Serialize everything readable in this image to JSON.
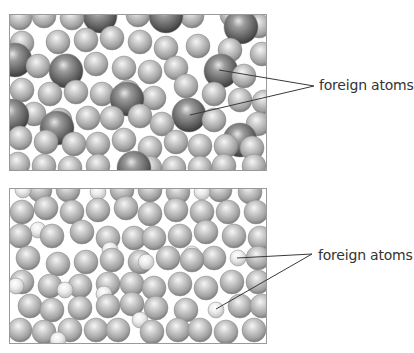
{
  "figure": {
    "width": 410,
    "height": 353,
    "colors": {
      "background": "#ffffff",
      "frame": "#9a9a9a",
      "leader": "#3a3a3a",
      "label": "#333333",
      "host_atom_light": "#f4f4f4",
      "host_atom_mid": "#b4b4b4",
      "host_atom_dark": "#7a7a7a",
      "foreign_large_light": "#dcdcdc",
      "foreign_large_mid": "#6e6e6e",
      "foreign_large_dark": "#3c3c3c",
      "foreign_small_light": "#ffffff",
      "foreign_small_mid": "#e2e2e2",
      "foreign_small_dark": "#b8b8b8"
    }
  },
  "panels": [
    {
      "id": "top",
      "title": "Substitutional impurity with larger foreign atoms",
      "frame": {
        "x": 9,
        "y": 14,
        "w": 257,
        "h": 156
      },
      "label": {
        "text": "foreign atoms",
        "x": 319,
        "y": 77
      },
      "leader_apex": {
        "x": 314,
        "y": 86
      },
      "leader_targets": [
        {
          "x": 219,
          "y": 70
        },
        {
          "x": 190,
          "y": 115
        }
      ],
      "host_radius": 12,
      "foreign_radius": 17,
      "host_atoms": [
        [
          20,
          18
        ],
        [
          44,
          16
        ],
        [
          72,
          18
        ],
        [
          138,
          15
        ],
        [
          192,
          16
        ],
        [
          232,
          15
        ],
        [
          259,
          26
        ],
        [
          22,
          43
        ],
        [
          58,
          42
        ],
        [
          86,
          40
        ],
        [
          112,
          38
        ],
        [
          140,
          42
        ],
        [
          166,
          48
        ],
        [
          198,
          46
        ],
        [
          230,
          50
        ],
        [
          38,
          66
        ],
        [
          68,
          66
        ],
        [
          96,
          64
        ],
        [
          124,
          68
        ],
        [
          150,
          72
        ],
        [
          176,
          68
        ],
        [
          244,
          76
        ],
        [
          262,
          54
        ],
        [
          22,
          90
        ],
        [
          50,
          94
        ],
        [
          76,
          92
        ],
        [
          102,
          94
        ],
        [
          128,
          92
        ],
        [
          154,
          98
        ],
        [
          186,
          86
        ],
        [
          214,
          94
        ],
        [
          240,
          100
        ],
        [
          264,
          102
        ],
        [
          34,
          114
        ],
        [
          60,
          120
        ],
        [
          88,
          118
        ],
        [
          112,
          118
        ],
        [
          140,
          116
        ],
        [
          162,
          124
        ],
        [
          214,
          120
        ],
        [
          258,
          124
        ],
        [
          20,
          138
        ],
        [
          46,
          142
        ],
        [
          74,
          144
        ],
        [
          98,
          144
        ],
        [
          124,
          140
        ],
        [
          150,
          148
        ],
        [
          176,
          142
        ],
        [
          200,
          146
        ],
        [
          226,
          146
        ],
        [
          252,
          148
        ],
        [
          18,
          164
        ],
        [
          44,
          166
        ],
        [
          70,
          168
        ],
        [
          98,
          166
        ],
        [
          150,
          168
        ],
        [
          174,
          168
        ],
        [
          200,
          168
        ],
        [
          224,
          166
        ],
        [
          254,
          166
        ]
      ],
      "foreign_atoms": [
        [
          100,
          16
        ],
        [
          166,
          16
        ],
        [
          241,
          27
        ],
        [
          15,
          60
        ],
        [
          66,
          71
        ],
        [
          221,
          71
        ],
        [
          127,
          99
        ],
        [
          189,
          115
        ],
        [
          12,
          116
        ],
        [
          57,
          128
        ],
        [
          240,
          140
        ],
        [
          134,
          168
        ]
      ]
    },
    {
      "id": "bottom",
      "title": "Substitutional impurity with smaller foreign atoms",
      "frame": {
        "x": 9,
        "y": 188,
        "w": 257,
        "h": 155
      },
      "label": {
        "text": "foreign atoms",
        "x": 318,
        "y": 247
      },
      "leader_apex": {
        "x": 312,
        "y": 254
      },
      "leader_targets": [
        {
          "x": 237,
          "y": 258
        },
        {
          "x": 216,
          "y": 309
        }
      ],
      "host_radius": 12,
      "foreign_radius": 8,
      "host_atoms": [
        [
          40,
          190
        ],
        [
          68,
          190
        ],
        [
          122,
          190
        ],
        [
          150,
          190
        ],
        [
          178,
          192
        ],
        [
          220,
          190
        ],
        [
          250,
          192
        ],
        [
          22,
          212
        ],
        [
          46,
          208
        ],
        [
          72,
          212
        ],
        [
          98,
          210
        ],
        [
          126,
          208
        ],
        [
          150,
          214
        ],
        [
          176,
          210
        ],
        [
          202,
          212
        ],
        [
          228,
          212
        ],
        [
          256,
          212
        ],
        [
          20,
          236
        ],
        [
          52,
          236
        ],
        [
          82,
          232
        ],
        [
          108,
          238
        ],
        [
          134,
          238
        ],
        [
          154,
          238
        ],
        [
          180,
          236
        ],
        [
          206,
          232
        ],
        [
          234,
          236
        ],
        [
          260,
          238
        ],
        [
          28,
          258
        ],
        [
          58,
          264
        ],
        [
          86,
          262
        ],
        [
          112,
          260
        ],
        [
          140,
          262
        ],
        [
          168,
          258
        ],
        [
          192,
          260
        ],
        [
          214,
          258
        ],
        [
          258,
          258
        ],
        [
          22,
          282
        ],
        [
          50,
          286
        ],
        [
          80,
          286
        ],
        [
          108,
          284
        ],
        [
          132,
          284
        ],
        [
          154,
          288
        ],
        [
          180,
          284
        ],
        [
          206,
          288
        ],
        [
          232,
          282
        ],
        [
          258,
          282
        ],
        [
          30,
          306
        ],
        [
          52,
          310
        ],
        [
          80,
          308
        ],
        [
          108,
          306
        ],
        [
          132,
          304
        ],
        [
          156,
          308
        ],
        [
          186,
          310
        ],
        [
          240,
          306
        ],
        [
          262,
          306
        ],
        [
          20,
          330
        ],
        [
          44,
          332
        ],
        [
          70,
          330
        ],
        [
          96,
          330
        ],
        [
          118,
          330
        ],
        [
          152,
          332
        ],
        [
          178,
          330
        ],
        [
          200,
          330
        ],
        [
          226,
          332
        ],
        [
          254,
          330
        ]
      ],
      "foreign_atoms": [
        [
          23,
          190
        ],
        [
          98,
          192
        ],
        [
          202,
          192
        ],
        [
          38,
          230
        ],
        [
          110,
          250
        ],
        [
          146,
          262
        ],
        [
          192,
          254
        ],
        [
          238,
          258
        ],
        [
          16,
          286
        ],
        [
          65,
          290
        ],
        [
          104,
          294
        ],
        [
          140,
          320
        ],
        [
          216,
          310
        ],
        [
          58,
          340
        ]
      ]
    }
  ]
}
